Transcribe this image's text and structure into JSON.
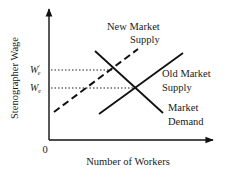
{
  "diagram": {
    "type": "supply-demand",
    "y_axis_label": "Stenographer Wage",
    "x_axis_label": "Number of Workers",
    "origin_label": "0",
    "wage_labels": {
      "new_equilibrium": {
        "base": "W",
        "prime": "′",
        "sub": "e"
      },
      "old_equilibrium": {
        "base": "W",
        "sub": "e"
      }
    },
    "curves": [
      {
        "id": "new-market-supply",
        "label_line1": "New Market",
        "label_line2": "Supply",
        "style": "dashed",
        "color": "#111111"
      },
      {
        "id": "old-market-supply",
        "label_line1": "Old Market",
        "label_line2": "Supply",
        "style": "solid",
        "color": "#111111"
      },
      {
        "id": "market-demand",
        "label_line1": "Market",
        "label_line2": "Demand",
        "style": "solid",
        "color": "#111111"
      }
    ],
    "guides": [
      {
        "id": "new-equilibrium-wage-guide",
        "style": "dotted"
      },
      {
        "id": "old-equilibrium-wage-guide",
        "style": "dotted"
      }
    ]
  }
}
